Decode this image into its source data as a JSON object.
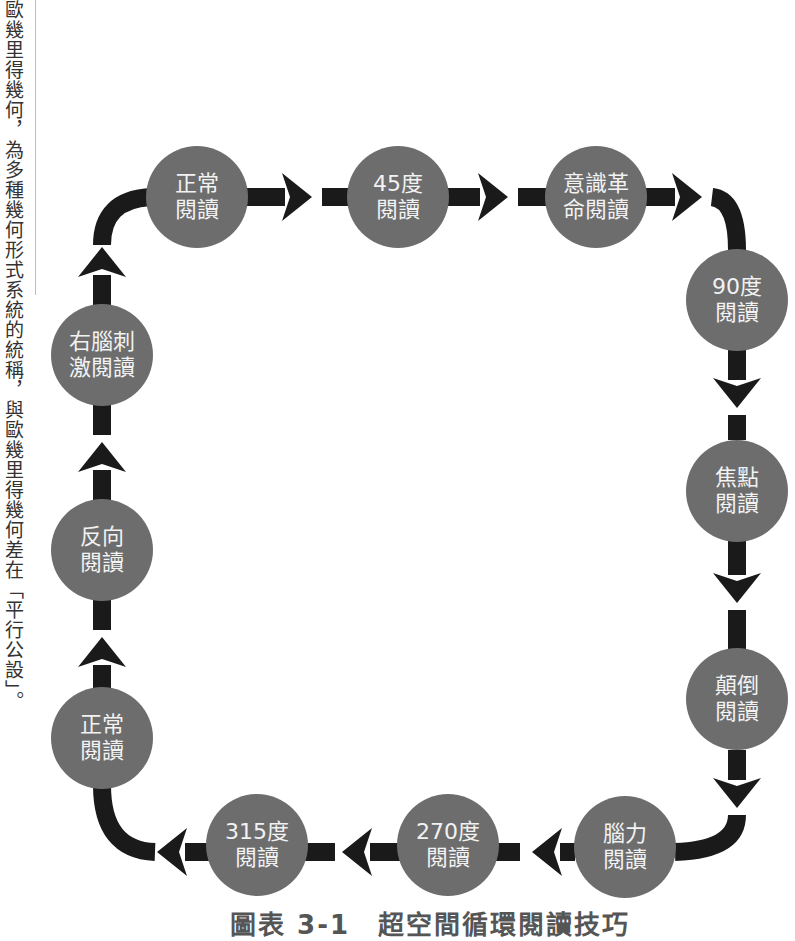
{
  "side_note": {
    "text": "歐幾里得幾何，為多種幾何形式系統的統稱，與歐幾里得幾何差在「平行公設」。"
  },
  "diagram": {
    "colors": {
      "node_fill": "#6d6d6d",
      "node_text": "#f2f2f2",
      "arrow": "#1a1a1a"
    },
    "nodes": [
      {
        "id": "normal-top",
        "line1": "正常",
        "line2": "閱讀"
      },
      {
        "id": "deg45",
        "line1": "45度",
        "line2": "閱讀"
      },
      {
        "id": "consciousness",
        "line1": "意識革",
        "line2": "命閱讀"
      },
      {
        "id": "deg90",
        "line1": "90度",
        "line2": "閱讀"
      },
      {
        "id": "focus",
        "line1": "焦點",
        "line2": "閱讀"
      },
      {
        "id": "upside-down",
        "line1": "顛倒",
        "line2": "閱讀"
      },
      {
        "id": "brainpower",
        "line1": "腦力",
        "line2": "閱讀"
      },
      {
        "id": "deg270",
        "line1": "270度",
        "line2": "閱讀"
      },
      {
        "id": "deg315",
        "line1": "315度",
        "line2": "閱讀"
      },
      {
        "id": "normal-bottom",
        "line1": "正常",
        "line2": "閱讀"
      },
      {
        "id": "reverse",
        "line1": "反向",
        "line2": "閱讀"
      },
      {
        "id": "right-brain",
        "line1": "右腦刺",
        "line2": "激閱讀"
      }
    ],
    "caption": "圖表 3-1　超空間循環閱讀技巧"
  }
}
